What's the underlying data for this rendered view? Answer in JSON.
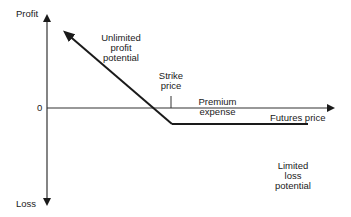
{
  "diagram": {
    "type": "payoff-diagram",
    "y_axis": {
      "top_label": "Profit",
      "bottom_label": "Loss",
      "zero_label": "0"
    },
    "x_axis": {
      "label": "Futures price"
    },
    "annotations": {
      "unlimited_profit": [
        "Unlimited",
        "profit",
        "potential"
      ],
      "strike_price": [
        "Strike",
        "price"
      ],
      "premium_expense": [
        "Premium",
        "expense"
      ],
      "limited_loss": [
        "Limited",
        "loss",
        "potential"
      ]
    },
    "payoff_line": {
      "points": [
        [
          63,
          30
        ],
        [
          172,
          124
        ],
        [
          308,
          124
        ]
      ],
      "description": "Long put: unlimited profit as price falls, loss limited to premium above strike"
    },
    "colors": {
      "line": "#1a1a1a",
      "axis": "#333333",
      "background": "#ffffff"
    }
  }
}
